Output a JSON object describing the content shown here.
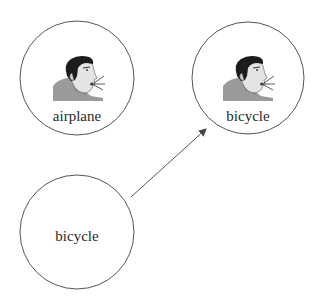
{
  "diagram": {
    "nodes": [
      {
        "id": "top-left",
        "label": "airplane",
        "has_speaker_icon": true,
        "cx": 77,
        "cy": 78,
        "r": 57
      },
      {
        "id": "top-right",
        "label": "bicycle",
        "has_speaker_icon": true,
        "cx": 248,
        "cy": 78,
        "r": 56
      },
      {
        "id": "bottom-left",
        "label": "bicycle",
        "has_speaker_icon": false,
        "cx": 77,
        "cy": 232,
        "r": 57
      }
    ],
    "edges": [
      {
        "from": "bottom-left",
        "to": "top-right",
        "style": "arrow"
      }
    ],
    "icons": {
      "speaker": "speaking-face-icon"
    },
    "colors": {
      "stroke": "#555555",
      "text": "#2a2a2a",
      "background": "#ffffff"
    }
  }
}
